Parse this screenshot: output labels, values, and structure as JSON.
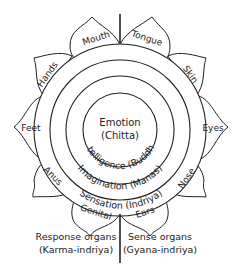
{
  "diagram": {
    "center": {
      "line1": "Emotion",
      "line2": "(Chitta)"
    },
    "rings": [
      {
        "label": "Intelligence (Buddhi)"
      },
      {
        "label": "Imagination (Manas)"
      },
      {
        "label": "Sensation (Indriya)"
      }
    ],
    "petals": [
      {
        "label": "Mouth"
      },
      {
        "label": "Tongue"
      },
      {
        "label": "Skin"
      },
      {
        "label": "Eyes"
      },
      {
        "label": "Nose"
      },
      {
        "label": "Ears"
      },
      {
        "label": "Genital"
      },
      {
        "label": "Anus"
      },
      {
        "label": "Feet"
      },
      {
        "label": "Hands"
      }
    ],
    "captions": {
      "left_line1": "Response organs",
      "left_line2": "(Karma-indriya)",
      "right_line1": "Sense organs",
      "right_line2": "(Gyana-indriya)"
    },
    "colors": {
      "stroke": "#222222",
      "background": "#ffffff"
    }
  }
}
